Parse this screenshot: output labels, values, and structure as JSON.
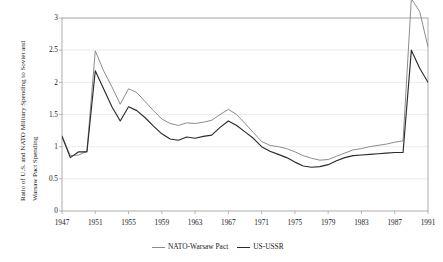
{
  "chart_data": {
    "type": "line",
    "title": "",
    "xlabel": "",
    "ylabel": "Ratio of U.S. and NATO Military Spending to Soviet and Warsaw Pact Spending",
    "ylabel_line1": "Ratio of U.S. and NATO Military Spending to Soviet and",
    "ylabel_line2": "Warsaw Pact Spending",
    "xlim": [
      1947,
      1991
    ],
    "ylim": [
      0,
      3
    ],
    "yticks": [
      0,
      0.5,
      1,
      1.5,
      2,
      2.5,
      3
    ],
    "ytick_labels": [
      "0",
      "0.5",
      "1",
      "1.5",
      "2",
      "2.5",
      "3"
    ],
    "xticks": [
      1947,
      1951,
      1955,
      1959,
      1963,
      1967,
      1971,
      1975,
      1979,
      1983,
      1987,
      1991
    ],
    "xtick_labels": [
      "1947",
      "1951",
      "1955",
      "1959",
      "1963",
      "1967",
      "1971",
      "1975",
      "1979",
      "1983",
      "1987",
      "1991"
    ],
    "grid": "horizontal",
    "legend_position": "bottom",
    "x": [
      1947,
      1948,
      1949,
      1950,
      1951,
      1952,
      1953,
      1954,
      1955,
      1956,
      1957,
      1958,
      1959,
      1960,
      1961,
      1962,
      1963,
      1964,
      1965,
      1966,
      1967,
      1968,
      1969,
      1970,
      1971,
      1972,
      1973,
      1974,
      1975,
      1976,
      1977,
      1978,
      1979,
      1980,
      1981,
      1982,
      1983,
      1984,
      1985,
      1986,
      1987,
      1988,
      1989,
      1990,
      1991
    ],
    "series": [
      {
        "name": "NATO-Warsaw Pact",
        "color": "#8c8c8c",
        "values": [
          1.17,
          0.86,
          0.87,
          0.93,
          2.49,
          2.18,
          1.93,
          1.66,
          1.9,
          1.84,
          1.7,
          1.56,
          1.43,
          1.36,
          1.33,
          1.37,
          1.36,
          1.38,
          1.41,
          1.5,
          1.58,
          1.5,
          1.36,
          1.22,
          1.08,
          1.02,
          1.0,
          0.97,
          0.92,
          0.86,
          0.82,
          0.79,
          0.8,
          0.85,
          0.9,
          0.95,
          0.97,
          1.0,
          1.02,
          1.04,
          1.07,
          1.09,
          3.3,
          3.1,
          2.55
        ]
      },
      {
        "name": "US-USSR",
        "color": "#2b2b2b",
        "values": [
          1.16,
          0.83,
          0.92,
          0.92,
          2.18,
          1.9,
          1.62,
          1.4,
          1.62,
          1.56,
          1.45,
          1.32,
          1.2,
          1.12,
          1.1,
          1.15,
          1.13,
          1.16,
          1.18,
          1.3,
          1.4,
          1.33,
          1.23,
          1.13,
          1.0,
          0.93,
          0.88,
          0.83,
          0.76,
          0.7,
          0.68,
          0.69,
          0.72,
          0.78,
          0.83,
          0.86,
          0.87,
          0.88,
          0.89,
          0.9,
          0.91,
          0.91,
          2.5,
          2.22,
          2.0
        ]
      }
    ]
  },
  "legend": {
    "entries": [
      {
        "label": "NATO-Warsaw Pact",
        "color": "#8c8c8c"
      },
      {
        "label": "US-USSR",
        "color": "#2b2b2b"
      }
    ]
  },
  "colors": {
    "axis": "#9a9a9a",
    "grid": "#e4e4e4",
    "text": "#1a1a1a",
    "background": "#ffffff",
    "series_nato": "#8c8c8c",
    "series_us": "#2b2b2b"
  }
}
